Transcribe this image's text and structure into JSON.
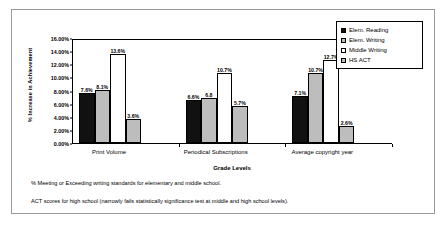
{
  "chart_data": {
    "type": "bar",
    "title": "",
    "xlabel": "Grade Levels",
    "ylabel": "% Increase in Achievement",
    "ylim": [
      0,
      16
    ],
    "ytick_labels": [
      "16.00%",
      "14.00%",
      "12.00%",
      "10.00%",
      "8.00%",
      "6.00%",
      "4.00%",
      "2.00%",
      "0.00%"
    ],
    "ytick_values": [
      16,
      14,
      12,
      10,
      8,
      6,
      4,
      2,
      0
    ],
    "grid": false,
    "legend_position": "top-right",
    "categories": [
      "Print Volume",
      "Periodical Subscriptions",
      "Average copyright year"
    ],
    "series": [
      {
        "name": "Elem. Reading",
        "color": "#111111",
        "values": [
          7.6,
          6.6,
          7.1
        ],
        "labels": [
          "7.6%",
          "6.6%",
          "7.1%"
        ]
      },
      {
        "name": "Elem. Writing",
        "color": "#bdbdbd",
        "values": [
          8.1,
          6.8,
          10.7
        ],
        "labels": [
          "8.1%",
          "6.8",
          "10.7%"
        ]
      },
      {
        "name": "Middle Writing",
        "color": "#ffffff",
        "values": [
          13.6,
          10.7,
          12.7
        ],
        "labels": [
          "13.6%",
          "10.7%",
          "12.7%"
        ]
      },
      {
        "name": "HS ACT",
        "color": "#bdbdbd",
        "values": [
          3.6,
          5.7,
          2.6
        ],
        "labels": [
          "3.6%",
          "5.7%",
          "2.6%"
        ]
      }
    ],
    "annotations": [
      "% Meeting or Exceeding writing standards for elementary and middle school.",
      "ACT scores for high school (narrowly fails statistically significance test at middle and high school levels)."
    ]
  }
}
